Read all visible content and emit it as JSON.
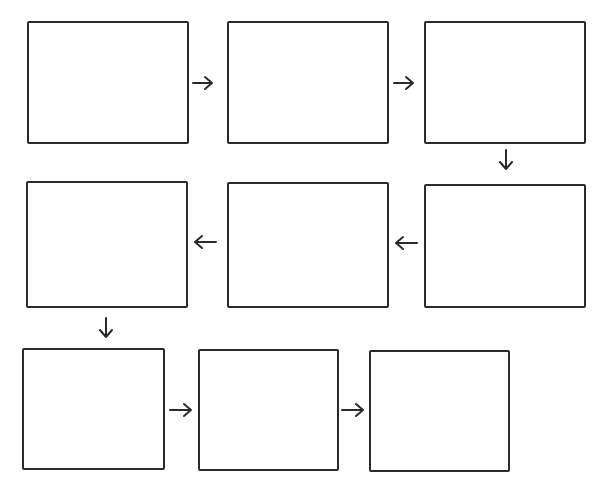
{
  "diagram": {
    "type": "serpentine-flow",
    "stroke_color": "#2a2a2a",
    "background_color": "#ffffff",
    "boxes": [
      {
        "id": 1,
        "row": 1,
        "col": 1,
        "label": ""
      },
      {
        "id": 2,
        "row": 1,
        "col": 2,
        "label": ""
      },
      {
        "id": 3,
        "row": 1,
        "col": 3,
        "label": ""
      },
      {
        "id": 4,
        "row": 2,
        "col": 3,
        "label": ""
      },
      {
        "id": 5,
        "row": 2,
        "col": 2,
        "label": ""
      },
      {
        "id": 6,
        "row": 2,
        "col": 1,
        "label": ""
      },
      {
        "id": 7,
        "row": 3,
        "col": 1,
        "label": ""
      },
      {
        "id": 8,
        "row": 3,
        "col": 2,
        "label": ""
      },
      {
        "id": 9,
        "row": 3,
        "col": 3,
        "label": ""
      }
    ],
    "arrows": [
      {
        "from": 1,
        "to": 2,
        "direction": "right"
      },
      {
        "from": 2,
        "to": 3,
        "direction": "right"
      },
      {
        "from": 3,
        "to": 4,
        "direction": "down"
      },
      {
        "from": 4,
        "to": 5,
        "direction": "left"
      },
      {
        "from": 5,
        "to": 6,
        "direction": "left"
      },
      {
        "from": 6,
        "to": 7,
        "direction": "down"
      },
      {
        "from": 7,
        "to": 8,
        "direction": "right"
      },
      {
        "from": 8,
        "to": 9,
        "direction": "right"
      }
    ]
  }
}
